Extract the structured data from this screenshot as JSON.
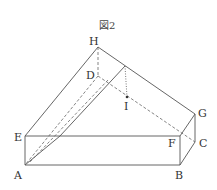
{
  "figure": {
    "title": "図2",
    "labels": {
      "H": "H",
      "D": "D",
      "I": "I",
      "G": "G",
      "F": "F",
      "C": "C",
      "E": "E",
      "A": "A",
      "B": "B"
    },
    "colors": {
      "line": "#555555",
      "background": "#ffffff"
    }
  }
}
